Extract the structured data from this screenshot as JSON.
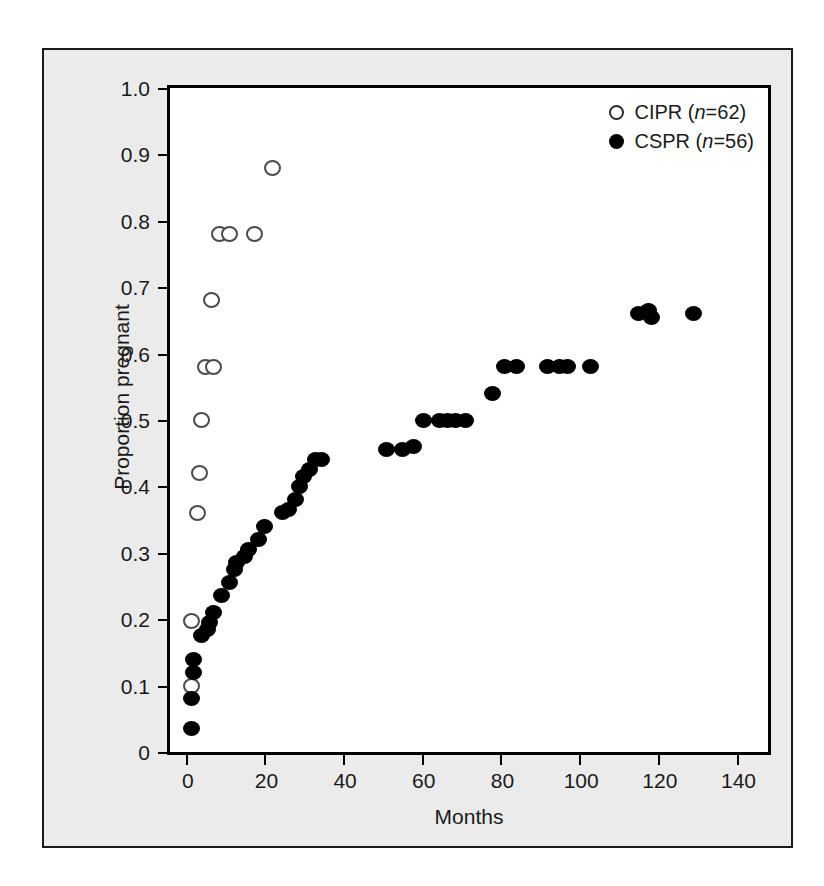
{
  "chart_data": {
    "type": "scatter",
    "title": "",
    "xlabel": "Months",
    "ylabel": "Proportion pregnant",
    "xlim": [
      -4,
      148
    ],
    "ylim": [
      0,
      1.0
    ],
    "xticks": [
      0,
      20,
      40,
      60,
      80,
      100,
      120,
      140
    ],
    "xtick_labels": [
      "0",
      "20",
      "40",
      "60",
      "80",
      "100",
      "120",
      "140"
    ],
    "yticks": [
      0,
      0.1,
      0.2,
      0.3,
      0.4,
      0.5,
      0.6,
      0.7,
      0.8,
      0.9,
      1.0
    ],
    "ytick_labels": [
      "0",
      "0.1",
      "0.2",
      "0.3",
      "0.4",
      "0.5",
      "0.6",
      "0.7",
      "0.8",
      "0.9",
      "1.0"
    ],
    "grid": false,
    "legend_position": "top-right",
    "series": [
      {
        "name": "CIPR",
        "label": "CIPR (n=62)",
        "marker": "open-circle",
        "color": "#ffffff",
        "edge_color": "#4a4a52",
        "n": 62,
        "points": [
          {
            "x": 1.5,
            "y": 0.1
          },
          {
            "x": 1.5,
            "y": 0.198
          },
          {
            "x": 3.0,
            "y": 0.36
          },
          {
            "x": 3.5,
            "y": 0.42
          },
          {
            "x": 4.0,
            "y": 0.5
          },
          {
            "x": 5.0,
            "y": 0.58
          },
          {
            "x": 7.0,
            "y": 0.58
          },
          {
            "x": 6.5,
            "y": 0.68
          },
          {
            "x": 8.5,
            "y": 0.78
          },
          {
            "x": 11.0,
            "y": 0.78
          },
          {
            "x": 17.5,
            "y": 0.78
          },
          {
            "x": 22.0,
            "y": 0.88
          }
        ]
      },
      {
        "name": "CSPR",
        "label": "CSPR (n=56)",
        "marker": "filled-circle",
        "color": "#000000",
        "n": 56,
        "points": [
          {
            "x": 1.5,
            "y": 0.035
          },
          {
            "x": 1.5,
            "y": 0.08
          },
          {
            "x": 2.0,
            "y": 0.12
          },
          {
            "x": 2.0,
            "y": 0.14
          },
          {
            "x": 4.0,
            "y": 0.175
          },
          {
            "x": 5.5,
            "y": 0.185
          },
          {
            "x": 6.0,
            "y": 0.195
          },
          {
            "x": 7.0,
            "y": 0.21
          },
          {
            "x": 9.0,
            "y": 0.235
          },
          {
            "x": 11.0,
            "y": 0.255
          },
          {
            "x": 12.5,
            "y": 0.275
          },
          {
            "x": 13.0,
            "y": 0.285
          },
          {
            "x": 15.0,
            "y": 0.295
          },
          {
            "x": 16.0,
            "y": 0.305
          },
          {
            "x": 18.5,
            "y": 0.32
          },
          {
            "x": 20.0,
            "y": 0.34
          },
          {
            "x": 24.5,
            "y": 0.36
          },
          {
            "x": 26.0,
            "y": 0.365
          },
          {
            "x": 28.0,
            "y": 0.38
          },
          {
            "x": 29.0,
            "y": 0.4
          },
          {
            "x": 30.0,
            "y": 0.415
          },
          {
            "x": 31.5,
            "y": 0.425
          },
          {
            "x": 33.0,
            "y": 0.44
          },
          {
            "x": 34.5,
            "y": 0.44
          },
          {
            "x": 51.0,
            "y": 0.455
          },
          {
            "x": 55.0,
            "y": 0.455
          },
          {
            "x": 58.0,
            "y": 0.46
          },
          {
            "x": 60.5,
            "y": 0.5
          },
          {
            "x": 64.5,
            "y": 0.5
          },
          {
            "x": 66.5,
            "y": 0.5
          },
          {
            "x": 68.5,
            "y": 0.5
          },
          {
            "x": 71.0,
            "y": 0.5
          },
          {
            "x": 78.0,
            "y": 0.54
          },
          {
            "x": 81.0,
            "y": 0.58
          },
          {
            "x": 84.0,
            "y": 0.58
          },
          {
            "x": 92.0,
            "y": 0.58
          },
          {
            "x": 95.0,
            "y": 0.58
          },
          {
            "x": 97.0,
            "y": 0.58
          },
          {
            "x": 103.0,
            "y": 0.58
          },
          {
            "x": 115.0,
            "y": 0.66
          },
          {
            "x": 117.5,
            "y": 0.665
          },
          {
            "x": 118.5,
            "y": 0.655
          },
          {
            "x": 129.0,
            "y": 0.66
          }
        ]
      }
    ]
  },
  "legend": {
    "items": [
      {
        "label_text": "CIPR (",
        "n_text": "n",
        "suffix": "=62)",
        "marker": "open-circle"
      },
      {
        "label_text": "CSPR (",
        "n_text": "n",
        "suffix": "=56)",
        "marker": "filled-circle"
      }
    ]
  }
}
